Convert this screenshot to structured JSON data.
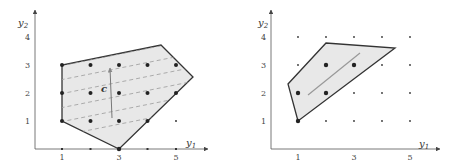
{
  "left_plot": {
    "x_label": "y",
    "x_label_sub": "1",
    "y_label": "y",
    "y_label_sub": "2",
    "x_ticks": [
      "1",
      "3",
      "5"
    ],
    "y_ticks": [
      "1",
      "2",
      "3",
      "4"
    ],
    "vector_label": "c",
    "polygon_vertices": [
      [
        1,
        3
      ],
      [
        1,
        1
      ],
      [
        3,
        0
      ],
      [
        5.6,
        2.6
      ],
      [
        4.5,
        3.7
      ]
    ],
    "lattice_points_inside": [
      [
        1,
        1
      ],
      [
        1,
        2
      ],
      [
        1,
        3
      ],
      [
        2,
        1
      ],
      [
        2,
        2
      ],
      [
        2,
        3
      ],
      [
        3,
        1
      ],
      [
        3,
        2
      ],
      [
        3,
        3
      ],
      [
        4,
        1
      ],
      [
        4,
        2
      ],
      [
        4,
        3
      ],
      [
        5,
        2
      ],
      [
        5,
        3
      ],
      [
        3,
        0
      ]
    ],
    "dashed_level_lines": 6
  },
  "right_plot": {
    "x_label": "y",
    "x_label_sub": "1",
    "y_label": "y",
    "y_label_sub": "2",
    "x_ticks": [
      "1",
      "3",
      "5"
    ],
    "y_ticks": [
      "1",
      "2",
      "3",
      "4"
    ],
    "polygon_vertices": [
      [
        1,
        1
      ],
      [
        0.6,
        2.3
      ],
      [
        2,
        3.8
      ],
      [
        4.5,
        3.6
      ]
    ],
    "lattice_points_inside": [
      [
        1,
        1
      ],
      [
        1,
        2
      ],
      [
        2,
        2
      ],
      [
        2,
        3
      ],
      [
        3,
        3
      ]
    ]
  },
  "colors": {
    "fill": "#e8e8e8",
    "edge": "#333333",
    "dashed": "#9a9a9a",
    "arrow": "#888888"
  }
}
